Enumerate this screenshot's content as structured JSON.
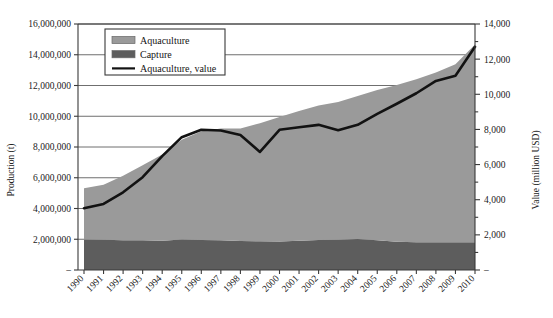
{
  "chart_data": {
    "type": "area",
    "title": "",
    "xlabel": "",
    "ylabel": "Production (t)",
    "y2label": "Value (million USD)",
    "grid": true,
    "legend_position": "top-left",
    "categories": [
      1990,
      1991,
      1992,
      1993,
      1994,
      1995,
      1996,
      1997,
      1998,
      1999,
      2000,
      2001,
      2002,
      2003,
      2004,
      2005,
      2006,
      2007,
      2008,
      2009,
      2010
    ],
    "xtick_labels": [
      "1990",
      "1991",
      "1992",
      "1993",
      "1994",
      "1995",
      "1996",
      "1997",
      "1998",
      "1999",
      "2000",
      "2001",
      "2002",
      "2003",
      "2004",
      "2005",
      "2006",
      "2007",
      "2008",
      "2009",
      "2010"
    ],
    "ylim": [
      0,
      16000000
    ],
    "ytick_labels": [
      "–",
      "2,000,000",
      "4,000,000",
      "6,000,000",
      "8,000,000",
      "10,000,000",
      "12,000,000",
      "14,000,000",
      "16,000,000"
    ],
    "ytick_values": [
      0,
      2000000,
      4000000,
      6000000,
      8000000,
      10000000,
      12000000,
      14000000,
      16000000
    ],
    "y2lim": [
      0,
      14000
    ],
    "y2tick_labels": [
      "–",
      "2,000",
      "4,000",
      "6,000",
      "8,000",
      "10,000",
      "12,000",
      "14,000"
    ],
    "y2tick_values": [
      0,
      2000,
      4000,
      6000,
      8000,
      10000,
      12000,
      14000
    ],
    "y2_minor_step": 1000,
    "series": [
      {
        "name": "Capture",
        "kind": "area",
        "axis": "left",
        "color": "#5d5d5d",
        "values": [
          1980000,
          1960000,
          1940000,
          1930000,
          1900000,
          1980000,
          1950000,
          1930000,
          1880000,
          1870000,
          1860000,
          1900000,
          1950000,
          1960000,
          2010000,
          1930000,
          1840000,
          1810000,
          1800000,
          1800000,
          1810000
        ]
      },
      {
        "name": "Aquaculture",
        "kind": "area",
        "axis": "left",
        "color": "#9a9a9a",
        "values": [
          3330000,
          3580000,
          4190000,
          4880000,
          5620000,
          6490000,
          7080000,
          7270000,
          7320000,
          7680000,
          8090000,
          8440000,
          8750000,
          8960000,
          9300000,
          9770000,
          10190000,
          10590000,
          11050000,
          11590000,
          12860000
        ]
      },
      {
        "name": "Aquaculture, value",
        "kind": "line",
        "axis": "right",
        "color": "#121212",
        "values": [
          3520,
          3760,
          4420,
          5280,
          6480,
          7560,
          7980,
          7940,
          7680,
          6720,
          7980,
          8120,
          8260,
          7960,
          8260,
          8880,
          9460,
          10060,
          10760,
          11060,
          12700
        ]
      }
    ],
    "legend": [
      {
        "label": "Aquaculture",
        "type": "swatch",
        "color": "#9a9a9a"
      },
      {
        "label": "Capture",
        "type": "swatch",
        "color": "#5d5d5d"
      },
      {
        "label": "Aquaculture, value",
        "type": "line",
        "color": "#121212"
      }
    ]
  }
}
